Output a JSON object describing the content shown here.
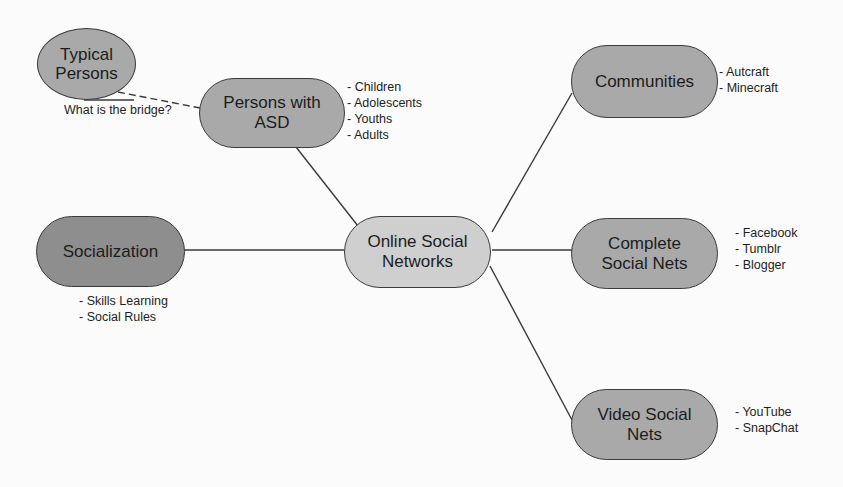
{
  "colors": {
    "background": "#fbfbfb",
    "node_fill": "#a9a9a9",
    "node_fill_dark": "#8e8e8e",
    "node_fill_center": "#cfcfcf",
    "stroke": "#3a3a3a"
  },
  "nodes": {
    "typical_persons": {
      "label": "Typical\nPersons"
    },
    "persons_asd": {
      "label": "Persons with\nASD",
      "items": [
        "- Children",
        "- Adolescents",
        "- Youths",
        "- Adults"
      ]
    },
    "communities": {
      "label": "Communities",
      "items": [
        "- Autcraft",
        "- Minecraft"
      ]
    },
    "socialization": {
      "label": "Socialization",
      "items": [
        "- Skills Learning",
        "- Social Rules"
      ]
    },
    "online_social_networks": {
      "label": "Online Social\nNetworks"
    },
    "complete_social_nets": {
      "label": "Complete\nSocial Nets",
      "items": [
        "- Facebook",
        "- Tumblr",
        "- Blogger"
      ]
    },
    "video_social_nets": {
      "label": "Video Social\nNets",
      "items": [
        "- YouTube",
        "- SnapChat"
      ]
    }
  },
  "annotations": {
    "bridge_question": "What is the bridge?"
  },
  "edges": [
    {
      "from": "online_social_networks",
      "to": "persons_asd",
      "style": "solid"
    },
    {
      "from": "online_social_networks",
      "to": "socialization",
      "style": "solid"
    },
    {
      "from": "online_social_networks",
      "to": "communities",
      "style": "solid"
    },
    {
      "from": "online_social_networks",
      "to": "complete_social_nets",
      "style": "solid"
    },
    {
      "from": "online_social_networks",
      "to": "video_social_nets",
      "style": "solid"
    },
    {
      "from": "typical_persons",
      "to": "persons_asd",
      "style": "dashed"
    }
  ]
}
